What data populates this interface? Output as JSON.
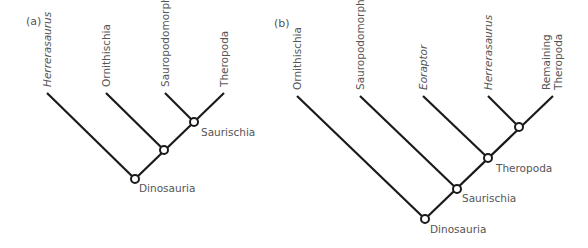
{
  "figure": {
    "panels": [
      {
        "id": "a",
        "label": "(a)",
        "taxa": [
          {
            "name": "Herrerasaurus",
            "italic": true
          },
          {
            "name": "Ornithischia",
            "italic": false
          },
          {
            "name": "Sauropodomorpha",
            "italic": false
          },
          {
            "name": "Theropoda",
            "italic": false
          }
        ],
        "clades": [
          {
            "name": "Saurischia"
          },
          {
            "name": ""
          },
          {
            "name": "Dinosauria"
          }
        ]
      },
      {
        "id": "b",
        "label": "(b)",
        "taxa": [
          {
            "name": "Ornithischia",
            "italic": false
          },
          {
            "name": "Sauropodomorpha",
            "italic": false
          },
          {
            "name": "Eoraptor",
            "italic": true
          },
          {
            "name": "Herrerasaurus",
            "italic": true
          },
          {
            "name": "Remaining",
            "italic": false,
            "line2": "Theropoda"
          }
        ],
        "clades": [
          {
            "name": ""
          },
          {
            "name": "Theropoda"
          },
          {
            "name": "Saurischia"
          },
          {
            "name": "Dinosauria"
          }
        ]
      }
    ]
  },
  "colors": {
    "line": "#1a1a1a",
    "text": "#555555",
    "background": "#ffffff"
  }
}
